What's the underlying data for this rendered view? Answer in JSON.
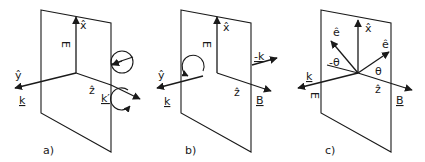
{
  "panels": [
    {
      "caption": "a)",
      "labels": {
        "x": "x̂",
        "y": "ŷ",
        "z": "ẑ",
        "E": "E",
        "k": "k",
        "k_prime": "k′"
      }
    },
    {
      "caption": "b)",
      "labels": {
        "x": "x̂",
        "y": "ŷ",
        "z": "ẑ",
        "E": "E",
        "k": "k",
        "minus_k": "-k",
        "B": "B"
      }
    },
    {
      "caption": "c)",
      "labels": {
        "x": "x̂",
        "z": "ẑ",
        "e_left": "ê",
        "e_right": "ê",
        "minus_theta": "-θ",
        "theta": "θ",
        "k": "k",
        "E": "E",
        "B": "B"
      }
    }
  ]
}
